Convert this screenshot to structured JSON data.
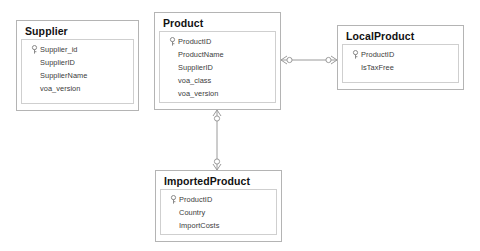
{
  "diagram": {
    "type": "entity-relationship-diagram",
    "notation": "crows-foot",
    "background_color": "#ffffff",
    "border_color": "#b4b4b4",
    "text_color": "#3b3b3b",
    "title_color": "#111111",
    "line_color": "#9a9a9a"
  },
  "entities": [
    {
      "name": "Supplier",
      "attributes": [
        {
          "name": "Supplier_id",
          "key": true
        },
        {
          "name": "SupplierID",
          "key": false
        },
        {
          "name": "SupplierName",
          "key": false
        },
        {
          "name": "voa_version",
          "key": false
        }
      ]
    },
    {
      "name": "Product",
      "attributes": [
        {
          "name": "ProductID",
          "key": true
        },
        {
          "name": "ProductName",
          "key": false
        },
        {
          "name": "SupplierID",
          "key": false
        },
        {
          "name": "voa_class",
          "key": false
        },
        {
          "name": "voa_version",
          "key": false
        }
      ]
    },
    {
      "name": "LocalProduct",
      "attributes": [
        {
          "name": "ProductID",
          "key": true
        },
        {
          "name": "IsTaxFree",
          "key": false
        }
      ]
    },
    {
      "name": "ImportedProduct",
      "attributes": [
        {
          "name": "ProductID",
          "key": true
        },
        {
          "name": "Country",
          "key": false
        },
        {
          "name": "ImportCosts",
          "key": false
        }
      ]
    }
  ],
  "relationships": [
    {
      "from": "Product",
      "to": "LocalProduct",
      "from_cardinality": "zero-or-many",
      "to_cardinality": "zero-or-many",
      "orientation": "horizontal"
    },
    {
      "from": "Product",
      "to": "ImportedProduct",
      "from_cardinality": "zero-or-many",
      "to_cardinality": "zero-or-many",
      "orientation": "vertical"
    }
  ]
}
